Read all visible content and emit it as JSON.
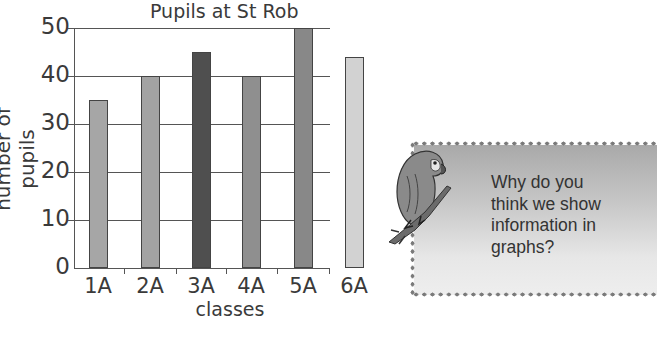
{
  "chart_data": {
    "type": "bar",
    "title": "Pupils at St Rob",
    "xlabel": "classes",
    "ylabel": "number of pupils",
    "categories": [
      "1A",
      "2A",
      "3A",
      "4A",
      "5A",
      "6A"
    ],
    "values": [
      35,
      40,
      45,
      40,
      50,
      44
    ],
    "ylim": [
      0,
      50
    ],
    "yticks": [
      "0",
      "10",
      "20",
      "30",
      "40",
      "50"
    ],
    "grid": true,
    "bar_colors": [
      "#a6a6a6",
      "#a3a3a3",
      "#4f4f4f",
      "#8f8f8f",
      "#888888",
      "#d2d2d2"
    ]
  },
  "note": {
    "line1": "Why do you",
    "line2": "think we show",
    "line3": "information in",
    "line4": "graphs?",
    "icon": "parrot-icon"
  }
}
